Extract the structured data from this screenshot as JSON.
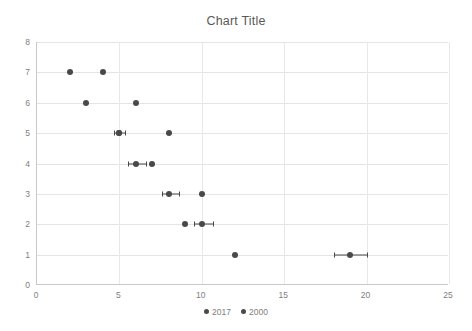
{
  "chart_data": {
    "type": "scatter",
    "title": "Chart Title",
    "xlabel": "",
    "ylabel": "",
    "xlim": [
      0,
      25
    ],
    "ylim": [
      0,
      8
    ],
    "xticks": [
      0,
      5,
      10,
      15,
      20,
      25
    ],
    "yticks": [
      0,
      1,
      2,
      3,
      4,
      5,
      6,
      7,
      8
    ],
    "grid": "both",
    "legend_position": "bottom",
    "series": [
      {
        "name": "2017",
        "marker_color": "#494949",
        "points": [
          {
            "x": 4,
            "y": 7
          },
          {
            "x": 6,
            "y": 6
          },
          {
            "x": 5,
            "y": 5,
            "xerr_low": 4.7,
            "xerr_high": 5.35
          },
          {
            "x": 8,
            "y": 5
          },
          {
            "x": 6,
            "y": 4,
            "xerr_low": 5.5,
            "xerr_high": 6.6
          },
          {
            "x": 7,
            "y": 4
          },
          {
            "x": 8,
            "y": 3,
            "xerr_low": 7.6,
            "xerr_high": 8.6
          },
          {
            "x": 10,
            "y": 3
          },
          {
            "x": 10,
            "y": 2,
            "xerr_low": 9.5,
            "xerr_high": 10.7
          },
          {
            "x": 19,
            "y": 1,
            "xerr_low": 18.0,
            "xerr_high": 20.0
          }
        ]
      },
      {
        "name": "2000",
        "marker_color": "#494949",
        "points": [
          {
            "x": 2,
            "y": 7
          },
          {
            "x": 3,
            "y": 6
          },
          {
            "x": 5,
            "y": 5
          },
          {
            "x": 9,
            "y": 2
          },
          {
            "x": 12,
            "y": 1
          }
        ]
      }
    ]
  },
  "colors": {
    "marker": "#494949",
    "gridline": "#e4e4e4",
    "axis": "#c8c8c8",
    "tick_text": "#808080",
    "title_text": "#595959",
    "background": "#ffffff"
  }
}
